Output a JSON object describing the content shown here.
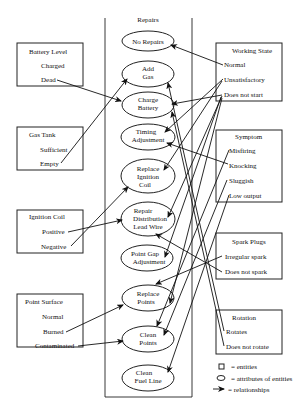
{
  "repairs": {
    "title": "Repairs",
    "items": [
      {
        "lines": [
          "No Repairs"
        ]
      },
      {
        "lines": [
          "Add",
          "Gas"
        ]
      },
      {
        "lines": [
          "Charge",
          "Battery"
        ]
      },
      {
        "lines": [
          "Timing",
          "Adjustment"
        ]
      },
      {
        "lines": [
          "Replace",
          "Ignition",
          "Coil"
        ]
      },
      {
        "lines": [
          "Repair",
          "Distribution",
          "Lead Wire"
        ]
      },
      {
        "lines": [
          "Point Gap",
          "Adjustment"
        ]
      },
      {
        "lines": [
          "Replace",
          "Points"
        ]
      },
      {
        "lines": [
          "Clean",
          "Points"
        ]
      },
      {
        "lines": [
          "Clean",
          "Fuel Line"
        ]
      }
    ]
  },
  "left_entities": [
    {
      "title": "Battery Level",
      "attributes": [
        "Charged",
        "Dead"
      ]
    },
    {
      "title": "Gas Tank",
      "attributes": [
        "Sufficient",
        "Empty"
      ]
    },
    {
      "title": "Ignition Coil",
      "attributes": [
        "Positive",
        "Negative"
      ]
    },
    {
      "title": "Point Surface",
      "attributes": [
        "Normal",
        "Burned",
        "Contaminated"
      ]
    }
  ],
  "right_entities": [
    {
      "title": "Working State",
      "attributes": [
        "Normal",
        "Unsatisfactory",
        "Does not start"
      ]
    },
    {
      "title": "Symptom",
      "attributes": [
        "Misfiring",
        "Knocking",
        "Sluggish",
        "Low output"
      ]
    },
    {
      "title": "Spark Plugs",
      "attributes": [
        "Irregular spark",
        "Does not spark"
      ]
    },
    {
      "title": "Rotation",
      "attributes": [
        "Rotates",
        "Does not rotate"
      ]
    }
  ],
  "legend": {
    "entities": "= entities",
    "attributes": "= attributes of entities",
    "relationships": "= relationships"
  },
  "relationships": [
    {
      "from": "Battery Level.Dead",
      "to": "Charge Battery"
    },
    {
      "from": "Gas Tank.Empty",
      "to": "Add Gas"
    },
    {
      "from": "Ignition Coil.Positive",
      "to": "Repair Distribution Lead Wire"
    },
    {
      "from": "Ignition Coil.Negative",
      "to": "Replace Ignition Coil"
    },
    {
      "from": "Point Surface.Burned",
      "to": "Replace Points"
    },
    {
      "from": "Point Surface.Contaminated",
      "to": "Clean Points"
    },
    {
      "from": "Working State.Normal",
      "to": "No Repairs"
    },
    {
      "from": "Working State.Unsatisfactory",
      "to": "Timing Adjustment"
    },
    {
      "from": "Working State.Unsatisfactory",
      "to": "Replace Ignition Coil"
    },
    {
      "from": "Working State.Does not start",
      "to": "Add Gas"
    },
    {
      "from": "Working State.Does not start",
      "to": "Charge Battery"
    },
    {
      "from": "Working State.Does not start",
      "to": "Replace Ignition Coil"
    },
    {
      "from": "Working State.Does not start",
      "to": "Repair Distribution Lead Wire"
    },
    {
      "from": "Symptom.Knocking",
      "to": "Timing Adjustment"
    },
    {
      "from": "Symptom.Misfiring",
      "to": "Point Gap Adjustment"
    },
    {
      "from": "Symptom.Sluggish",
      "to": "Clean Points"
    },
    {
      "from": "Symptom.Low output",
      "to": "Clean Points"
    },
    {
      "from": "Spark Plugs.Irregular spark",
      "to": "Replace Points"
    },
    {
      "from": "Spark Plugs.Does not spark",
      "to": "Repair Distribution Lead Wire"
    },
    {
      "from": "Rotation.Rotates",
      "to": "Add Gas"
    },
    {
      "from": "Rotation.Does not rotate",
      "to": "Charge Battery"
    }
  ]
}
